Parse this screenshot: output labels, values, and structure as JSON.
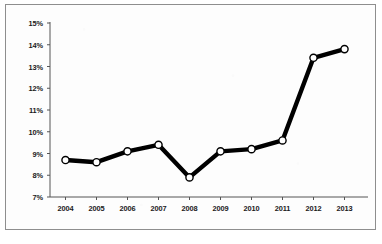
{
  "chart_data": {
    "type": "line",
    "title": "",
    "subtitle": "",
    "xlabel": "",
    "ylabel": "",
    "categories": [
      "2004",
      "2005",
      "2006",
      "2007",
      "2008",
      "2009",
      "2010",
      "2011",
      "2012",
      "2013"
    ],
    "values": [
      8.7,
      8.6,
      9.1,
      9.4,
      7.9,
      9.1,
      9.2,
      9.6,
      13.4,
      13.8
    ],
    "series": [
      {
        "name": "",
        "values": [
          8.7,
          8.6,
          9.1,
          9.4,
          7.9,
          9.1,
          9.2,
          9.6,
          13.4,
          13.8
        ]
      }
    ],
    "ylim": [
      7,
      15
    ],
    "ytick_values": [
      7,
      8,
      9,
      10,
      11,
      12,
      13,
      14,
      15
    ],
    "ytick_labels": [
      "7%",
      "8%",
      "9%",
      "10%",
      "11%",
      "12%",
      "13%",
      "14%",
      "15%"
    ],
    "xtick_labels": [
      "2004",
      "2005",
      "2006",
      "2007",
      "2008",
      "2009",
      "2010",
      "2011",
      "2012",
      "2013"
    ],
    "grid": false,
    "legend": null,
    "legend_position": "none",
    "annotations": [],
    "value_suffix": "%",
    "marker": "circle-open",
    "line_color": "#000000",
    "marker_fill": "#ffffff",
    "marker_stroke": "#000000",
    "axis_color": "#555555",
    "background_color": "#fdfdfd",
    "border_color": "#8e8e8e"
  },
  "layout": {
    "plot_left": 50,
    "plot_right": 360,
    "plot_top": 23,
    "plot_bottom": 197,
    "tick_len": 3,
    "marker_radius": 3.6,
    "line_width": 4.4
  }
}
